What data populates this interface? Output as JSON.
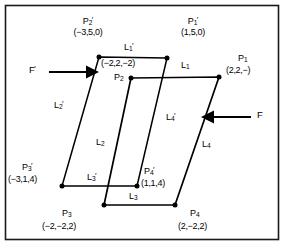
{
  "figure": {
    "frame_color": "#1a1a1a",
    "line_color": "#000000",
    "background": "#ffffff"
  },
  "forces": [
    {
      "id": "F-prime",
      "label": "F",
      "prime": "′",
      "direction": "right"
    },
    {
      "id": "F",
      "label": "F",
      "prime": "",
      "direction": "left"
    }
  ],
  "points": [
    {
      "id": "P1-prime",
      "name": "P",
      "index": "1",
      "prime": "′",
      "coord": "(1,5,0)"
    },
    {
      "id": "P2-prime",
      "name": "P",
      "index": "2",
      "prime": "′",
      "coord": "(−3,5,0)"
    },
    {
      "id": "P3-prime",
      "name": "P",
      "index": "3",
      "prime": "′",
      "coord": "(−3,1,4)"
    },
    {
      "id": "P4-prime",
      "name": "P",
      "index": "4",
      "prime": "′",
      "coord": "(1,1,4)"
    },
    {
      "id": "P1",
      "name": "P",
      "index": "1",
      "prime": "",
      "coord": "(2,2,−)"
    },
    {
      "id": "P2",
      "name": "P",
      "index": "2",
      "prime": "",
      "coord": "(−2,2,−2)"
    },
    {
      "id": "P3",
      "name": "P",
      "index": "3",
      "prime": "",
      "coord": "(−2,−2,2)"
    },
    {
      "id": "P4",
      "name": "P",
      "index": "4",
      "prime": "",
      "coord": "(2,−2,2)"
    }
  ],
  "edges": [
    {
      "id": "L1-prime",
      "name": "L",
      "index": "1",
      "prime": "′"
    },
    {
      "id": "L2-prime",
      "name": "L",
      "index": "2",
      "prime": "′"
    },
    {
      "id": "L3-prime",
      "name": "L",
      "index": "3",
      "prime": "′"
    },
    {
      "id": "L4-prime",
      "name": "L",
      "index": "4",
      "prime": "′"
    },
    {
      "id": "L1",
      "name": "L",
      "index": "1",
      "prime": ""
    },
    {
      "id": "L2",
      "name": "L",
      "index": "2",
      "prime": ""
    },
    {
      "id": "L3",
      "name": "L",
      "index": "3",
      "prime": ""
    },
    {
      "id": "L4",
      "name": "L",
      "index": "4",
      "prime": ""
    }
  ],
  "shapes": {
    "primed_parallelogram": {
      "vertices": [
        "P2-prime",
        "P1-prime",
        "P4-prime",
        "P3-prime"
      ],
      "note": "deformed outline drawn with lighter stroke"
    },
    "unprimed_parallelogram": {
      "vertices": [
        "P2",
        "P1",
        "P4",
        "P3"
      ],
      "note": "original outline"
    }
  }
}
